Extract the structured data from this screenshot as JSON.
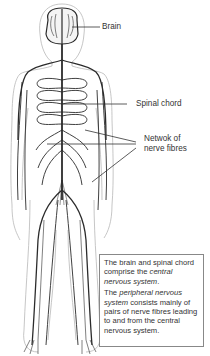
{
  "diagram": {
    "labels": {
      "brain": "Brain",
      "spinal_cord": "Spinal chord",
      "network_line1": "Netwok of",
      "network_line2": "nerve fibres"
    },
    "caption": {
      "p1_part1": "The brain and spinal chord comprise the ",
      "p1_italic": "central nervous system",
      "p1_part2": ".",
      "p2_part1": "The ",
      "p2_italic": "peripheral nervous system",
      "p2_part2": " consists mainly of pairs of nerve fibres leading to and from the central nervous system."
    },
    "colors": {
      "nerve": "#2b2b2b",
      "outline": "#b5b5b5",
      "leader": "#333333",
      "box_border": "#888888"
    }
  }
}
